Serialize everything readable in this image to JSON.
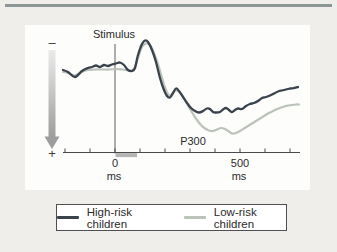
{
  "figure": {
    "background": "#f0eeea",
    "panel_background": "#fdfdfc",
    "top_rule_color": "#8d9697"
  },
  "chart_data": {
    "type": "line",
    "title": "",
    "xlabel": "ms",
    "ylabel": "",
    "x_axis": {
      "unit": "ms",
      "range_ms": [
        -208,
        740
      ],
      "ticks_ms": [
        -200,
        -100,
        0,
        100,
        200,
        300,
        400,
        500,
        600,
        700
      ],
      "labeled_ticks": [
        {
          "value": 0,
          "label": "0",
          "unit_label": "ms"
        },
        {
          "value": 500,
          "label": "500",
          "unit_label": "ms"
        }
      ]
    },
    "y_axis": {
      "top_label": "–",
      "bottom_label": "+",
      "polarity_note": "negative up, positive down",
      "amplitude_unit": "a.u.",
      "amp_range": [
        -8,
        14
      ]
    },
    "annotations": [
      {
        "id": "stimulus",
        "text": "Stimulus",
        "x_ms": 0
      },
      {
        "id": "p300",
        "text": "P300",
        "x_ms": 312,
        "amp": 14.5
      }
    ],
    "stimulus_marker_ms": [
      2,
      88
    ],
    "grid": false,
    "legend_position": "bottom",
    "series": [
      {
        "name": "High-risk children",
        "color": "#3a434b",
        "stroke_width": 2.3,
        "points": [
          [
            -208,
            0.1
          ],
          [
            -188,
            0.5
          ],
          [
            -160,
            1.5
          ],
          [
            -132,
            0.3
          ],
          [
            -108,
            -0.3
          ],
          [
            -92,
            -0.5
          ],
          [
            -76,
            -0.8
          ],
          [
            -60,
            -0.5
          ],
          [
            -44,
            -0.9
          ],
          [
            -28,
            -0.7
          ],
          [
            -12,
            -1.0
          ],
          [
            4,
            -1.2
          ],
          [
            20,
            -1.4
          ],
          [
            36,
            -0.9
          ],
          [
            52,
            0.1
          ],
          [
            68,
            0.3
          ],
          [
            80,
            -0.3
          ],
          [
            92,
            -2.9
          ],
          [
            108,
            -5.1
          ],
          [
            120,
            -5.8
          ],
          [
            132,
            -5.5
          ],
          [
            148,
            -3.9
          ],
          [
            164,
            -1.5
          ],
          [
            180,
            1.7
          ],
          [
            196,
            4.1
          ],
          [
            208,
            5.3
          ],
          [
            220,
            5.6
          ],
          [
            232,
            4.7
          ],
          [
            244,
            3.8
          ],
          [
            256,
            4.3
          ],
          [
            272,
            5.5
          ],
          [
            288,
            6.7
          ],
          [
            304,
            7.7
          ],
          [
            320,
            8.3
          ],
          [
            336,
            8.6
          ],
          [
            352,
            8.3
          ],
          [
            368,
            7.8
          ],
          [
            380,
            7.9
          ],
          [
            392,
            8.5
          ],
          [
            404,
            8.6
          ],
          [
            420,
            8.5
          ],
          [
            432,
            8.0
          ],
          [
            444,
            7.7
          ],
          [
            456,
            8.1
          ],
          [
            468,
            8.5
          ],
          [
            480,
            8.1
          ],
          [
            492,
            7.8
          ],
          [
            508,
            7.9
          ],
          [
            524,
            7.3
          ],
          [
            540,
            6.9
          ],
          [
            556,
            6.7
          ],
          [
            572,
            6.3
          ],
          [
            588,
            5.7
          ],
          [
            604,
            5.5
          ],
          [
            620,
            5.2
          ],
          [
            636,
            4.8
          ],
          [
            652,
            4.4
          ],
          [
            668,
            4.2
          ],
          [
            684,
            4.0
          ],
          [
            700,
            3.8
          ],
          [
            716,
            3.7
          ],
          [
            732,
            3.5
          ]
        ]
      },
      {
        "name": "Low-risk children",
        "color": "#bcc3ba",
        "stroke_width": 2.2,
        "points": [
          [
            -208,
            0.5
          ],
          [
            -188,
            0.7
          ],
          [
            -160,
            1.2
          ],
          [
            -132,
            0.5
          ],
          [
            -108,
            0.1
          ],
          [
            -80,
            0.0
          ],
          [
            -52,
            0.0
          ],
          [
            -24,
            0.0
          ],
          [
            4,
            -0.1
          ],
          [
            32,
            0.0
          ],
          [
            60,
            0.2
          ],
          [
            76,
            -0.1
          ],
          [
            92,
            -2.3
          ],
          [
            108,
            -4.5
          ],
          [
            124,
            -5.2
          ],
          [
            140,
            -4.9
          ],
          [
            156,
            -3.3
          ],
          [
            172,
            -1.1
          ],
          [
            188,
            1.7
          ],
          [
            204,
            4.1
          ],
          [
            216,
            5.2
          ],
          [
            228,
            4.9
          ],
          [
            240,
            4.2
          ],
          [
            252,
            4.3
          ],
          [
            264,
            4.9
          ],
          [
            280,
            6.1
          ],
          [
            296,
            7.5
          ],
          [
            312,
            8.9
          ],
          [
            328,
            10.1
          ],
          [
            344,
            11.1
          ],
          [
            360,
            11.8
          ],
          [
            376,
            12.2
          ],
          [
            392,
            12.3
          ],
          [
            408,
            12.0
          ],
          [
            424,
            11.7
          ],
          [
            440,
            11.9
          ],
          [
            456,
            12.4
          ],
          [
            468,
            12.8
          ],
          [
            484,
            12.7
          ],
          [
            500,
            12.3
          ],
          [
            516,
            11.8
          ],
          [
            532,
            11.3
          ],
          [
            548,
            10.8
          ],
          [
            564,
            10.3
          ],
          [
            580,
            9.8
          ],
          [
            596,
            9.3
          ],
          [
            612,
            8.8
          ],
          [
            628,
            8.4
          ],
          [
            644,
            8.0
          ],
          [
            660,
            7.7
          ],
          [
            676,
            7.4
          ],
          [
            692,
            7.2
          ],
          [
            708,
            7.1
          ],
          [
            724,
            7.0
          ],
          [
            736,
            7.0
          ]
        ]
      }
    ]
  },
  "legend": {
    "items": [
      {
        "label": "High-risk children",
        "color": "#3a434b"
      },
      {
        "label": "Low-risk children",
        "color": "#bcc3ba"
      }
    ]
  }
}
